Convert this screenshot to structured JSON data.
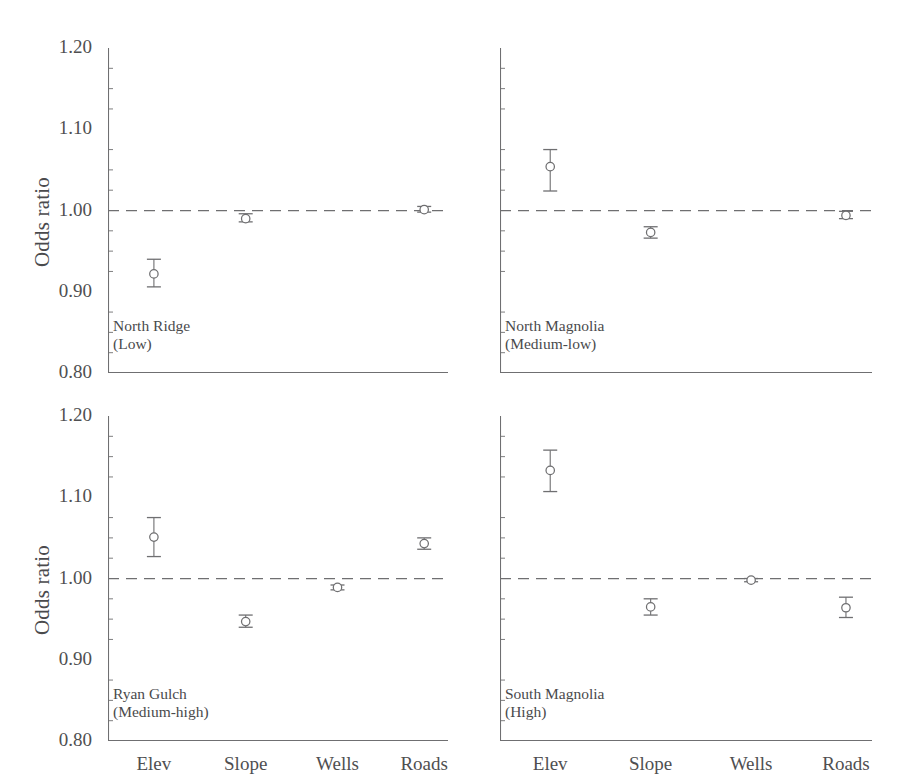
{
  "axis": {
    "ylabel": "Odds ratio",
    "yticks": [
      "1.20",
      "1.10",
      "1.00",
      "0.90",
      "0.80"
    ],
    "xticks": [
      "Elev",
      "Slope",
      "Wells",
      "Roads"
    ],
    "reference_line_value": "1.00",
    "line_color": "#6f6f71",
    "marker_color": "#6f6f71"
  },
  "chart_data": {
    "type": "scatter",
    "title": "",
    "xlabel": "",
    "ylabel": "Odds ratio",
    "ylim": [
      0.8,
      1.2
    ],
    "yticks": [
      1.2,
      1.1,
      1.0,
      0.9,
      0.8
    ],
    "categories": [
      "Elev",
      "Slope",
      "Wells",
      "Roads"
    ],
    "grid": false,
    "legend": "none",
    "reference_line": 1.0,
    "marker": "open-circle-with-error-bars",
    "error_bars": "95% confidence interval",
    "panels": [
      {
        "id": "north-ridge",
        "name": "North Ridge",
        "level": "(Low)",
        "position": "top-left",
        "points": [
          {
            "category": "Elev",
            "value": 0.922,
            "low": 0.906,
            "high": 0.94
          },
          {
            "category": "Slope",
            "value": 0.99,
            "low": 0.986,
            "high": 0.996
          },
          {
            "category": "Wells",
            "value": null,
            "low": null,
            "high": null
          },
          {
            "category": "Roads",
            "value": 1.001,
            "low": 0.998,
            "high": 1.005
          }
        ]
      },
      {
        "id": "north-magnolia",
        "name": "North Magnolia",
        "level": "(Medium-low)",
        "position": "top-right",
        "points": [
          {
            "category": "Elev",
            "value": 1.054,
            "low": 1.024,
            "high": 1.075
          },
          {
            "category": "Slope",
            "value": 0.973,
            "low": 0.966,
            "high": 0.98
          },
          {
            "category": "Wells",
            "value": null,
            "low": null,
            "high": null
          },
          {
            "category": "Roads",
            "value": 0.994,
            "low": 0.99,
            "high": 0.999
          }
        ]
      },
      {
        "id": "ryan-gulch",
        "name": "Ryan Gulch",
        "level": "(Medium-high)",
        "position": "bottom-left",
        "points": [
          {
            "category": "Elev",
            "value": 1.051,
            "low": 1.027,
            "high": 1.075
          },
          {
            "category": "Slope",
            "value": 0.947,
            "low": 0.94,
            "high": 0.955
          },
          {
            "category": "Wells",
            "value": 0.989,
            "low": 0.986,
            "high": 0.992
          },
          {
            "category": "Roads",
            "value": 1.043,
            "low": 1.036,
            "high": 1.05
          }
        ]
      },
      {
        "id": "south-magnolia",
        "name": "South Magnolia",
        "level": "(High)",
        "position": "bottom-right",
        "points": [
          {
            "category": "Elev",
            "value": 1.133,
            "low": 1.107,
            "high": 1.158
          },
          {
            "category": "Slope",
            "value": 0.965,
            "low": 0.955,
            "high": 0.975
          },
          {
            "category": "Wells",
            "value": 0.998,
            "low": 0.996,
            "high": 1.0
          },
          {
            "category": "Roads",
            "value": 0.964,
            "low": 0.952,
            "high": 0.977
          }
        ]
      }
    ]
  }
}
